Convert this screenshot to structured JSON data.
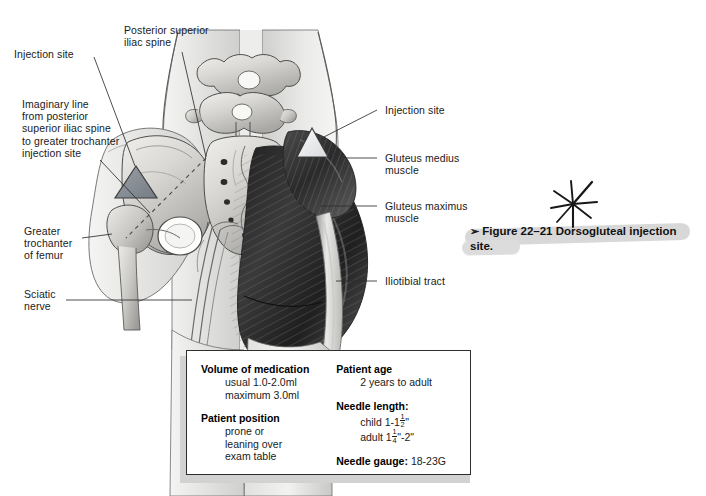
{
  "figure": {
    "caption_marker": "➢",
    "caption_text": "Figure 22–21 Dorsogluteal injection site.",
    "caption_line1": "Figure 22–21 Dorsogluteal injection",
    "caption_line2": "site."
  },
  "annotations": {
    "star_mark": "hand-drawn-asterisk"
  },
  "labels": {
    "left": [
      {
        "name": "injection-site-left",
        "text": "Injection site"
      },
      {
        "name": "posterior-superior-iliac-spine",
        "text": "Posterior superior\niliac spine"
      },
      {
        "name": "imaginary-line",
        "text": "Imaginary line\nfrom posterior\nsuperior iliac spine\nto greater trochanter\ninjection site"
      },
      {
        "name": "greater-trochanter-of-femur",
        "text": "Greater\ntrochanter\nof femur"
      },
      {
        "name": "sciatic-nerve",
        "text": "Sciatic\nnerve"
      }
    ],
    "right": [
      {
        "name": "injection-site-right",
        "text": "Injection site"
      },
      {
        "name": "gluteus-medius-muscle",
        "text": "Gluteus medius\nmuscle"
      },
      {
        "name": "gluteus-maximus-muscle",
        "text": "Gluteus maximus\nmuscle"
      },
      {
        "name": "iliotibial-tract",
        "text": "Iliotibial tract"
      }
    ]
  },
  "info_box": {
    "volume_heading": "Volume of medication",
    "volume_usual": "usual 1.0-2.0ml",
    "volume_maximum": "maximum 3.0ml",
    "position_heading": "Patient position",
    "position_line1": "prone or",
    "position_line2": "leaning over",
    "position_line3": "exam table",
    "age_heading": "Patient age",
    "age_value": "2 years to adult",
    "needle_length_heading": "Needle length:",
    "needle_child_prefix": "child 1-1",
    "needle_child_num": "1",
    "needle_child_den": "2",
    "needle_child_suffix": "\"",
    "needle_adult_prefix": "adult 1",
    "needle_adult_num": "1",
    "needle_adult_den": "4",
    "needle_adult_suffix": "\"-2\"",
    "needle_gauge_heading": "Needle gauge:",
    "needle_gauge_value": "18-23G"
  },
  "colors": {
    "injection_triangle_left": "#8a8f96",
    "injection_triangle_right": "#e8eaec",
    "bone": "#d6d6d4",
    "muscle_dark": "#2f2f2f",
    "skin": "#eeeeec",
    "box_border": "#2e2e2e",
    "highlight": "#d8d8d8"
  }
}
